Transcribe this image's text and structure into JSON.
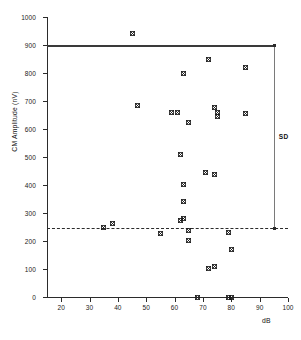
{
  "figure": {
    "xlabel": "dB",
    "ylabel": "CM Amplitude (nV)",
    "annotation_sd": "SD"
  },
  "axis": {
    "y_ticks": [
      "0",
      "100",
      "200",
      "300",
      "400",
      "500",
      "600",
      "700",
      "800",
      "900",
      "1000"
    ],
    "x_ticks": [
      "20",
      "30",
      "40",
      "50",
      "60",
      "70",
      "80",
      "90",
      "100"
    ]
  },
  "chart_data": {
    "type": "scatter",
    "title": "",
    "xlabel": "dB",
    "ylabel": "CM Amplitude (nV)",
    "xlim": [
      15,
      100
    ],
    "ylim": [
      0,
      1000
    ],
    "xticks": [
      20,
      30,
      40,
      50,
      60,
      70,
      80,
      90,
      100
    ],
    "yticks": [
      0,
      100,
      200,
      300,
      400,
      500,
      600,
      700,
      800,
      900,
      1000
    ],
    "grid": false,
    "legend": null,
    "marker": "x-in-square",
    "reference_lines": [
      {
        "type": "horizontal",
        "style": "solid",
        "y": 900,
        "x_start": 15,
        "x_end": 95,
        "label": ""
      },
      {
        "type": "horizontal",
        "style": "dashed",
        "y": 245,
        "x_start": 15,
        "x_end": 100,
        "label": ""
      }
    ],
    "annotations": [
      {
        "text": "SD",
        "type": "vertical-range-bracket",
        "x": 95,
        "y_top": 900,
        "y_bottom": 245
      }
    ],
    "points": [
      {
        "x": 45,
        "y": 940
      },
      {
        "x": 72,
        "y": 850
      },
      {
        "x": 85,
        "y": 820
      },
      {
        "x": 63,
        "y": 800
      },
      {
        "x": 47,
        "y": 685
      },
      {
        "x": 74,
        "y": 678
      },
      {
        "x": 59,
        "y": 660
      },
      {
        "x": 61,
        "y": 658
      },
      {
        "x": 75,
        "y": 658
      },
      {
        "x": 85,
        "y": 655
      },
      {
        "x": 75,
        "y": 645
      },
      {
        "x": 65,
        "y": 622
      },
      {
        "x": 62,
        "y": 510
      },
      {
        "x": 71,
        "y": 443
      },
      {
        "x": 74,
        "y": 438
      },
      {
        "x": 63,
        "y": 402
      },
      {
        "x": 63,
        "y": 340
      },
      {
        "x": 63,
        "y": 282
      },
      {
        "x": 62,
        "y": 272
      },
      {
        "x": 38,
        "y": 262
      },
      {
        "x": 35,
        "y": 250
      },
      {
        "x": 65,
        "y": 237
      },
      {
        "x": 79,
        "y": 232
      },
      {
        "x": 55,
        "y": 228
      },
      {
        "x": 65,
        "y": 203
      },
      {
        "x": 80,
        "y": 170
      },
      {
        "x": 74,
        "y": 108
      },
      {
        "x": 72,
        "y": 102
      },
      {
        "x": 68,
        "y": 0
      },
      {
        "x": 79,
        "y": 0
      },
      {
        "x": 80,
        "y": 0
      }
    ]
  }
}
